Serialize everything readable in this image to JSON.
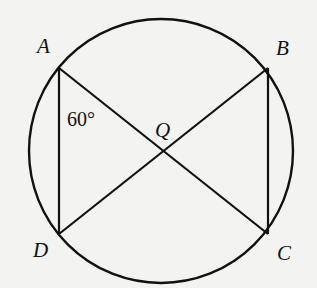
{
  "diagram": {
    "type": "geometry",
    "colors": {
      "background": "#f3f3f1",
      "stroke": "#111111"
    },
    "circle": {
      "cx": 161,
      "cy": 151,
      "r": 132
    },
    "points": {
      "A": {
        "label": "A",
        "x": 59,
        "y": 68
      },
      "B": {
        "label": "B",
        "x": 268,
        "y": 68
      },
      "C": {
        "label": "C",
        "x": 268,
        "y": 234
      },
      "D": {
        "label": "D",
        "x": 59,
        "y": 234
      },
      "Q": {
        "label": "Q",
        "x": 163,
        "y": 151
      }
    },
    "segments": [
      {
        "from": "A",
        "to": "D"
      },
      {
        "from": "B",
        "to": "C"
      },
      {
        "from": "A",
        "to": "C"
      },
      {
        "from": "B",
        "to": "D"
      }
    ],
    "angle_label": {
      "text": "60°",
      "at_vertex": "A",
      "between": [
        "AD",
        "AC"
      ]
    }
  }
}
